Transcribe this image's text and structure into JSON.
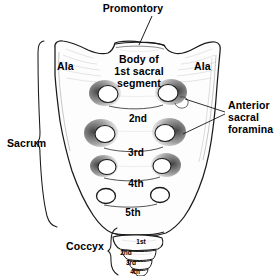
{
  "figure": {
    "bone_fill": "#fdfdfd",
    "outline_color": "#1a1a1a",
    "text_color": "#000000",
    "background": "#ffffff",
    "foramen_fill": "#ffffff",
    "foramen_shading": "#2b2b2b"
  },
  "labels": {
    "promontory": "Promontory",
    "ala_left": "Ala",
    "ala_right": "Ala",
    "body_line1": "Body of",
    "body_line2": "1st sacral",
    "body_line3": "segment",
    "sacrum": "Sacrum",
    "anterior_line1": "Anterior",
    "anterior_line2": "sacral",
    "anterior_line3": "foramina",
    "coccyx": "Coccyx"
  },
  "sacral_segments": [
    {
      "label": "2nd"
    },
    {
      "label": "3rd"
    },
    {
      "label": "4th"
    },
    {
      "label": "5th"
    }
  ],
  "coccygeal_segments": [
    {
      "label": "1st"
    },
    {
      "label": "2nd"
    },
    {
      "label": "3rd"
    },
    {
      "label": "4th"
    }
  ]
}
